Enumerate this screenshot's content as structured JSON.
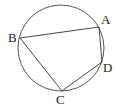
{
  "diagram": {
    "type": "inscribed-quadrilateral",
    "circle": {
      "cx": 61,
      "cy": 48,
      "r": 43,
      "stroke": "#555555"
    },
    "points": {
      "A": {
        "x": 99,
        "y": 27
      },
      "B": {
        "x": 20,
        "y": 38
      },
      "C": {
        "x": 62,
        "y": 91
      },
      "D": {
        "x": 102,
        "y": 62
      }
    },
    "segments": [
      [
        "B",
        "A"
      ],
      [
        "A",
        "D"
      ],
      [
        "D",
        "C"
      ],
      [
        "C",
        "B"
      ]
    ],
    "labels": [
      {
        "text": "A",
        "x": 101,
        "y": 24
      },
      {
        "text": "B",
        "x": 8,
        "y": 42
      },
      {
        "text": "C",
        "x": 56,
        "y": 104
      },
      {
        "text": "D",
        "x": 103,
        "y": 72
      }
    ]
  }
}
